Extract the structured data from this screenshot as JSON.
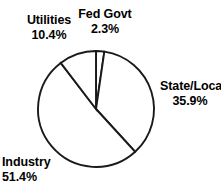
{
  "chart_data": {
    "type": "pie",
    "title": "",
    "subtitle": "",
    "xlabel": "",
    "ylabel": "",
    "grid": false,
    "legend_position": "none",
    "label_style": "external",
    "total_percent": 100.0,
    "start_angle_deg": 0,
    "direction": "clockwise",
    "categories": [
      "Fed Govt",
      "State/Local",
      "Industry",
      "Utilities"
    ],
    "values": [
      2.3,
      35.9,
      51.4,
      10.4
    ],
    "slices": [
      {
        "label": "Fed Govt",
        "percent": 2.3,
        "percent_text": "2.3%",
        "fill": "#ffffff",
        "stroke": "#1a1a1a",
        "label_position": "top"
      },
      {
        "label": "State/Local",
        "percent": 35.9,
        "percent_text": "35.9%",
        "fill": "#ffffff",
        "stroke": "#1a1a1a",
        "label_position": "right"
      },
      {
        "label": "Industry",
        "percent": 51.4,
        "percent_text": "51.4%",
        "fill": "#ffffff",
        "stroke": "#1a1a1a",
        "label_position": "bottom-left"
      },
      {
        "label": "Utilities",
        "percent": 10.4,
        "percent_text": "10.4%",
        "fill": "#ffffff",
        "stroke": "#1a1a1a",
        "label_position": "top-left"
      }
    ]
  },
  "labels": {
    "utilities": {
      "name": "Utilities",
      "percent": "10.4%"
    },
    "fed_govt": {
      "name": "Fed Govt",
      "percent": "2.3%"
    },
    "state_local": {
      "name": "State/Local",
      "percent": "35.9%"
    },
    "industry": {
      "name": "Industry",
      "percent": "51.4%"
    }
  },
  "colors": {
    "background": "#ffffff",
    "slice_fill": "#ffffff",
    "outline": "#1a1a1a",
    "text": "#000000"
  }
}
